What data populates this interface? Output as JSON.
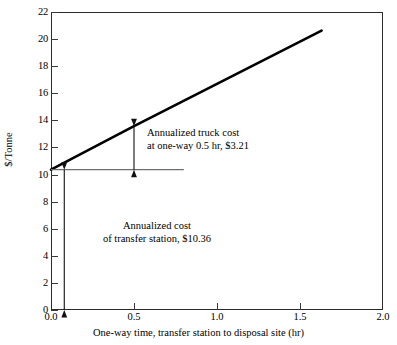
{
  "chart_data": {
    "type": "line",
    "title": "",
    "xlabel": "One-way time, transfer station to disposal site (hr)",
    "ylabel": "$/Tonne",
    "xlim": [
      0.0,
      2.0
    ],
    "ylim": [
      0,
      22
    ],
    "grid": false,
    "legend": null,
    "xticks": [
      0.0,
      0.5,
      1.0,
      1.5,
      2.0
    ],
    "xtick_labels": [
      "0.0",
      "0.5",
      "1.0",
      "1.5",
      "2.0"
    ],
    "yticks": [
      0,
      2,
      4,
      6,
      8,
      10,
      12,
      14,
      16,
      18,
      20,
      22
    ],
    "ytick_labels": [
      "0",
      "2",
      "4",
      "6",
      "8",
      "10",
      "12",
      "14",
      "16",
      "18",
      "20",
      "22"
    ],
    "series": [
      {
        "name": "Total annualized cost",
        "x": [
          0.0,
          0.5,
          1.63
        ],
        "values": [
          10.36,
          13.57,
          20.62
        ]
      }
    ],
    "reference_lines": [
      {
        "name": "transfer-station-cost-baseline",
        "orientation": "horizontal",
        "y": 10.36,
        "x_start": 0.0,
        "x_end": 0.8
      }
    ],
    "annotations": [
      {
        "name": "truck-cost-annotation",
        "line1": "Annualized truck cost",
        "line2": "at one-way 0.5 hr, $3.21",
        "value": 3.21,
        "at_x": 0.5,
        "span_y": [
          10.36,
          13.57
        ]
      },
      {
        "name": "transfer-station-annotation",
        "line1": "Annualized cost",
        "line2": "of transfer station, $10.36",
        "value": 10.36,
        "at_x": 0.08,
        "span_y": [
          0,
          10.36
        ]
      }
    ]
  },
  "axes": {
    "y_title": "$/Tonne",
    "x_title": "One-way time, transfer station to disposal site (hr)"
  },
  "colors": {
    "line": "#000000",
    "frame": "#2b2b2b",
    "reference": "#6f6f6f",
    "arrow": "#111111",
    "background": "#ffffff"
  }
}
